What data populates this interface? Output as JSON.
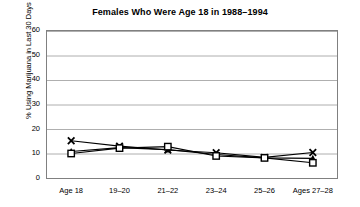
{
  "chart_data": {
    "type": "line",
    "title": "Females Who Were Age 18 in 1988–1994",
    "xlabel": "",
    "ylabel": "% Using Marijuana in Last 30 Days",
    "categories": [
      "Age 18",
      "19–20",
      "21–22",
      "23–24",
      "25–26",
      "Ages 27–28"
    ],
    "ylim": [
      0,
      60
    ],
    "yticks": [
      0,
      10,
      20,
      30,
      40,
      50,
      60
    ],
    "grid": "horizontal",
    "legend": "none",
    "series": [
      {
        "name": "series-x",
        "marker": "x",
        "values": [
          15.2,
          13.0,
          11.4,
          10.3,
          8.4,
          10.4
        ]
      },
      {
        "name": "series-triangle",
        "marker": "triangle",
        "values": [
          10.8,
          12.4,
          11.6,
          9.6,
          8.2,
          8.0
        ]
      },
      {
        "name": "series-square",
        "marker": "square",
        "values": [
          10.0,
          12.2,
          12.8,
          9.0,
          8.2,
          6.2
        ]
      }
    ]
  },
  "axis": {
    "y_tick_labels": [
      "60",
      "50",
      "40",
      "30",
      "20",
      "10",
      "0"
    ]
  }
}
